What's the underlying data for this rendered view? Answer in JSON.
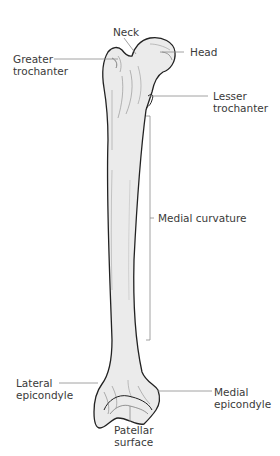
{
  "diagram": {
    "colors": {
      "bone_fill": "#ebebeb",
      "bone_outline": "#222222",
      "leader_line": "#8a8a8a",
      "label_text": "#3a3a3a"
    },
    "labels": {
      "neck": "Neck",
      "head": "Head",
      "greater_trochanter_1": "Greater",
      "greater_trochanter_2": "trochanter",
      "lesser_trochanter_1": "Lesser",
      "lesser_trochanter_2": "trochanter",
      "medial_curvature": "Medial curvature",
      "lateral_epicondyle_1": "Lateral",
      "lateral_epicondyle_2": "epicondyle",
      "medial_epicondyle_1": "Medial",
      "medial_epicondyle_2": "epicondyle",
      "patellar_surface_1": "Patellar",
      "patellar_surface_2": "surface"
    }
  }
}
